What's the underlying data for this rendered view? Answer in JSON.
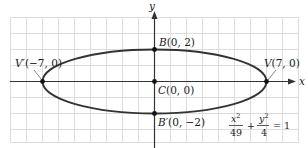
{
  "figure": {
    "equation": {
      "term1_num": "x",
      "term1_num_exp": "2",
      "term1_den": "49",
      "plus": "+",
      "term2_num": "y",
      "term2_num_exp": "2",
      "term2_den": "4",
      "equals": "= 1"
    },
    "axes": {
      "x_label": "x",
      "y_label": "y"
    },
    "points": [
      {
        "id": "V-prime",
        "name": "V′",
        "coords": "(−7, 0)",
        "x": -7,
        "y": 0
      },
      {
        "id": "V",
        "name": "V",
        "coords": "(7, 0)",
        "x": 7,
        "y": 0
      },
      {
        "id": "B",
        "name": "B",
        "coords": "(0, 2)",
        "x": 0,
        "y": 2
      },
      {
        "id": "B-prime",
        "name": "B′",
        "coords": "(0, −2)",
        "x": 0,
        "y": -2
      },
      {
        "id": "C",
        "name": "C",
        "coords": "(0, 0)",
        "x": 0,
        "y": 0
      }
    ],
    "ellipse": {
      "a": 7,
      "b": 2,
      "center": [
        0,
        0
      ]
    },
    "colors": {
      "grid": "#d9d9d9",
      "curve": "#333333",
      "axis": "#333333",
      "point": "#111111"
    }
  }
}
